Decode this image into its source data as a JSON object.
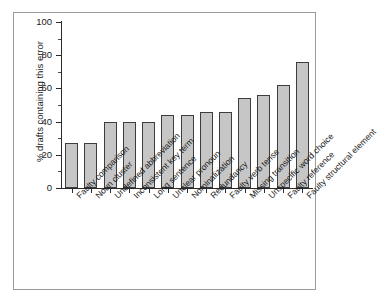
{
  "chart_data": {
    "type": "bar",
    "title": "",
    "subtitle": "",
    "xlabel": "",
    "ylabel": "% drafts containing this error",
    "ylim": [
      0,
      100
    ],
    "xlim": null,
    "grid": false,
    "legend": null,
    "legend_position": "none",
    "y_ticks": [
      0,
      20,
      40,
      60,
      80,
      100
    ],
    "y_tick_labels": [
      "0",
      "20",
      "40",
      "60",
      "80",
      "100"
    ],
    "y_minor_ticks": [
      10,
      30,
      50,
      70,
      90
    ],
    "categories": [
      "Faulty comparison",
      "Noun cluster",
      "Undefined abbreviation",
      "Inconsistent key term",
      "Long sentence",
      "Unclear pronoun",
      "Nominalization",
      "Redundancy",
      "Faulty verb tense",
      "Missing transition",
      "Unspecific word choice",
      "Faulty reference",
      "Faulty structural element"
    ],
    "values": [
      27,
      27,
      40,
      40,
      40,
      44,
      44,
      46,
      46,
      54,
      56,
      62,
      76
    ],
    "bar_color": "#c6c6c6",
    "bar_edge_color": "#3d3d3d",
    "axis_color": "#2b2b2b",
    "background_color": "#ffffff",
    "frame_color": "#9a9a9a"
  }
}
